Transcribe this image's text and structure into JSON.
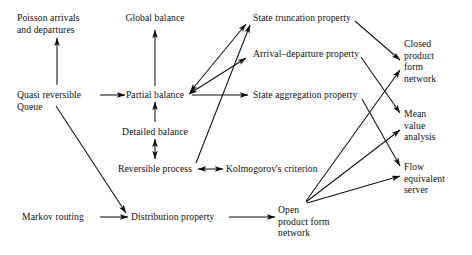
{
  "diagram": {
    "type": "flow-diagram",
    "background_color": "#ffffff",
    "stroke_color": "#101010",
    "nodes": [
      {
        "id": "poisson",
        "label": "Poisson arrivals\nand departures",
        "x": 17,
        "y": 12,
        "align": "l"
      },
      {
        "id": "global",
        "label": "Global balance",
        "x": 155,
        "y": 12,
        "align": "c"
      },
      {
        "id": "truncation",
        "label": "State truncation property",
        "x": 253,
        "y": 12,
        "align": "l"
      },
      {
        "id": "closed",
        "label": "Closed\nproduct\nform\nnetwork",
        "x": 404,
        "y": 38,
        "align": "l"
      },
      {
        "id": "arrival",
        "label": "Arrival–departure property",
        "x": 253,
        "y": 48,
        "align": "l"
      },
      {
        "id": "quasi",
        "label": "Quasi reversible\nQueue",
        "x": 17,
        "y": 89,
        "align": "l"
      },
      {
        "id": "partial",
        "label": "Partial balance",
        "x": 155,
        "y": 89,
        "align": "c"
      },
      {
        "id": "aggregation",
        "label": "State aggregation property",
        "x": 253,
        "y": 89,
        "align": "l"
      },
      {
        "id": "mean",
        "label": "Mean\nvalue\nanalysis",
        "x": 404,
        "y": 108,
        "align": "l"
      },
      {
        "id": "detailed",
        "label": "Detailed balance",
        "x": 155,
        "y": 126,
        "align": "c"
      },
      {
        "id": "flow",
        "label": "Flow\nequivalent\nserver",
        "x": 404,
        "y": 161,
        "align": "l"
      },
      {
        "id": "reversible",
        "label": "Reversible process",
        "x": 155,
        "y": 163,
        "align": "c"
      },
      {
        "id": "kolmogorov",
        "label": "Kolmogorov's criterion",
        "x": 226,
        "y": 163,
        "align": "l"
      },
      {
        "id": "markov",
        "label": "Markov routing",
        "x": 22,
        "y": 211,
        "align": "l"
      },
      {
        "id": "distribution",
        "label": "Distribution property",
        "x": 131,
        "y": 211,
        "align": "l"
      },
      {
        "id": "open",
        "label": "Open\nproduct form\nnetwork",
        "x": 278,
        "y": 204,
        "align": "l"
      }
    ],
    "edges": [
      {
        "from": "quasi",
        "to": "poisson",
        "heads": "single"
      },
      {
        "from": "quasi",
        "to": "partial",
        "heads": "single"
      },
      {
        "from": "quasi",
        "to": "distribution",
        "heads": "single"
      },
      {
        "from": "partial",
        "to": "global",
        "heads": "single"
      },
      {
        "from": "detailed",
        "to": "partial",
        "heads": "single"
      },
      {
        "from": "reversible",
        "to": "detailed",
        "heads": "double"
      },
      {
        "from": "reversible",
        "to": "kolmogorov",
        "heads": "double"
      },
      {
        "from": "reversible",
        "to": "truncation",
        "heads": "single"
      },
      {
        "from": "partial",
        "to": "truncation",
        "heads": "double"
      },
      {
        "from": "partial",
        "to": "arrival",
        "heads": "double"
      },
      {
        "from": "partial",
        "to": "aggregation",
        "heads": "single"
      },
      {
        "from": "truncation",
        "to": "closed",
        "heads": "single"
      },
      {
        "from": "arrival",
        "to": "mean",
        "heads": "single"
      },
      {
        "from": "aggregation",
        "to": "flow",
        "heads": "single"
      },
      {
        "from": "markov",
        "to": "distribution",
        "heads": "single"
      },
      {
        "from": "distribution",
        "to": "open",
        "heads": "single"
      },
      {
        "from": "open",
        "to": "closed",
        "heads": "single"
      },
      {
        "from": "open",
        "to": "mean",
        "heads": "single"
      },
      {
        "from": "open",
        "to": "flow",
        "heads": "single"
      }
    ]
  }
}
